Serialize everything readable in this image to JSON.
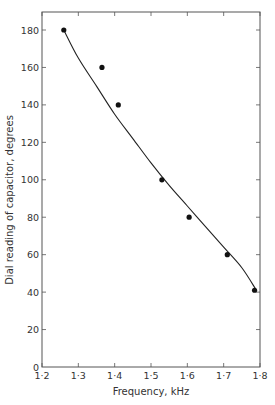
{
  "chart_data": {
    "type": "scatter",
    "title": "",
    "xlabel": "Frequency, kHz",
    "ylabel": "Dial reading of capacitor, degrees",
    "xlim": [
      1.2,
      1.8
    ],
    "ylim": [
      0,
      190
    ],
    "x_ticks": [
      "1·2",
      "1·3",
      "1·4",
      "1·5",
      "1·6",
      "1·7",
      "1·8"
    ],
    "x_tick_values": [
      1.2,
      1.3,
      1.4,
      1.5,
      1.6,
      1.7,
      1.8
    ],
    "y_ticks": [
      "0",
      "20",
      "40",
      "60",
      "80",
      "100",
      "120",
      "140",
      "160",
      "180"
    ],
    "y_tick_values": [
      0,
      20,
      40,
      60,
      80,
      100,
      120,
      140,
      160,
      180
    ],
    "grid": false,
    "legend": null,
    "series": [
      {
        "name": "Measured points",
        "marker": "filled-circle",
        "x": [
          1.26,
          1.365,
          1.41,
          1.53,
          1.605,
          1.71,
          1.785
        ],
        "y": [
          180,
          160,
          140,
          100,
          80,
          60,
          41
        ]
      },
      {
        "name": "Fitted curve",
        "style": "smooth-line",
        "x": [
          1.26,
          1.3,
          1.35,
          1.4,
          1.45,
          1.5,
          1.55,
          1.6,
          1.65,
          1.7,
          1.75,
          1.79
        ],
        "y": [
          180,
          165,
          150,
          135,
          122,
          109,
          97,
          86,
          75,
          64,
          53,
          41
        ]
      }
    ]
  }
}
